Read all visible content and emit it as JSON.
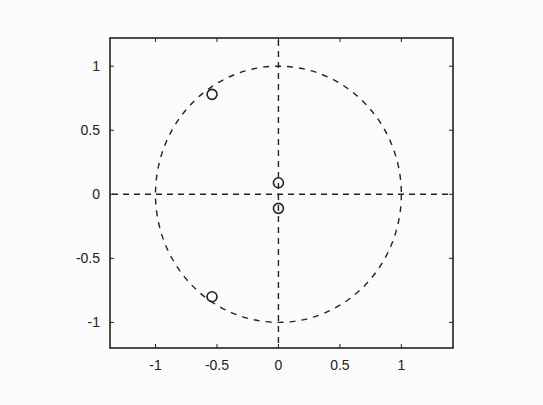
{
  "chart_data": {
    "type": "scatter",
    "title": "",
    "xlabel": "",
    "ylabel": "",
    "xlim": [
      -1.37,
      1.42
    ],
    "ylim": [
      -1.2,
      1.22
    ],
    "grid": false,
    "legend": null,
    "x_ticks": [
      -1,
      -0.5,
      0,
      0.5,
      1
    ],
    "x_tick_labels": [
      "-1",
      "-0.5",
      "0",
      "0.5",
      "1"
    ],
    "y_ticks": [
      1,
      0.5,
      0,
      -0.5,
      -1
    ],
    "y_tick_labels": [
      "1",
      "0.5",
      "0",
      "-0.5",
      "-1"
    ],
    "annotations": {
      "unit_circle": {
        "style": "dashed",
        "center": [
          0,
          0
        ],
        "radius": 1
      },
      "axes_lines": {
        "style": "dashed",
        "x0": true,
        "y0": true
      }
    },
    "series": [
      {
        "name": "zeros",
        "marker": "o",
        "points": [
          {
            "x": -0.54,
            "y": 0.78
          },
          {
            "x": -0.54,
            "y": -0.8
          },
          {
            "x": 0.0,
            "y": 0.09
          },
          {
            "x": 0.0,
            "y": -0.11
          }
        ]
      }
    ]
  }
}
